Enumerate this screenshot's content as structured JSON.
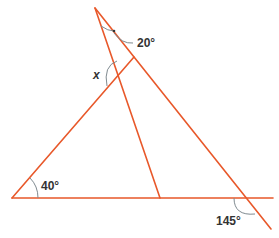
{
  "diagram": {
    "type": "geometry-angles",
    "line_color": "#e8582a",
    "arc_color": "#7f8a90",
    "labels": {
      "apex_angle": "20°",
      "unknown_angle": "x",
      "base_left_angle": "40°",
      "exterior_angle": "145°"
    }
  }
}
